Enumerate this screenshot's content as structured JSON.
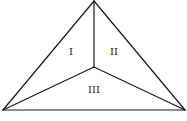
{
  "diagram": {
    "type": "triangle-partition",
    "vertices": {
      "apex": [
        94,
        1
      ],
      "bottom_left": [
        3,
        110
      ],
      "bottom_right": [
        185,
        110
      ],
      "interior": [
        94,
        67
      ]
    },
    "regions": [
      {
        "id": "region-1",
        "label": "I",
        "position": [
          71,
          52
        ]
      },
      {
        "id": "region-2",
        "label": "II",
        "position": [
          114,
          52
        ]
      },
      {
        "id": "region-3",
        "label": "III",
        "position": [
          94,
          90
        ]
      }
    ],
    "stroke_color": "#1a1a1a",
    "background": "#ffffff"
  }
}
